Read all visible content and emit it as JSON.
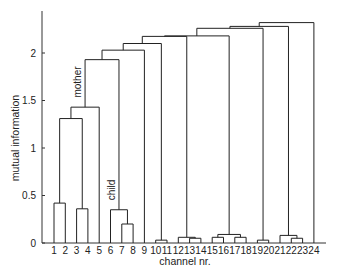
{
  "chart_data": {
    "type": "dendrogram",
    "title": "",
    "xlabel": "channel nr.",
    "ylabel": "mutual information",
    "ylim": [
      0,
      2.45
    ],
    "yticks": [
      0,
      0.5,
      1,
      1.5,
      2
    ],
    "ytick_labels": [
      "0",
      "0.5",
      "1",
      "1.5",
      "2"
    ],
    "grid": false,
    "leaves": [
      "1",
      "2",
      "3",
      "4",
      "5",
      "6",
      "7",
      "8",
      "9",
      "10",
      "11",
      "12",
      "13",
      "14",
      "15",
      "16",
      "17",
      "18",
      "19",
      "20",
      "21",
      "22",
      "23",
      "24"
    ],
    "merges": [
      {
        "id": "c1",
        "left": "1",
        "right": "2",
        "height": 0.42
      },
      {
        "id": "c2",
        "left": "3",
        "right": "4",
        "height": 0.36
      },
      {
        "id": "c3",
        "left": "c1",
        "right": "c2",
        "height": 1.31
      },
      {
        "id": "c4",
        "left": "c3",
        "right": "5",
        "height": 1.43
      },
      {
        "id": "c5",
        "left": "7",
        "right": "8",
        "height": 0.2
      },
      {
        "id": "c6",
        "left": "6",
        "right": "c5",
        "height": 0.35
      },
      {
        "id": "c7",
        "left": "c4",
        "right": "c6",
        "height": 1.93
      },
      {
        "id": "c8",
        "left": "c7",
        "right": "9",
        "height": 2.03
      },
      {
        "id": "c9",
        "left": "10",
        "right": "11",
        "height": 0.03
      },
      {
        "id": "c10",
        "left": "c8",
        "right": "c9",
        "height": 2.1
      },
      {
        "id": "c11",
        "left": "13",
        "right": "14",
        "height": 0.05
      },
      {
        "id": "c12",
        "left": "12",
        "right": "c11",
        "height": 0.06
      },
      {
        "id": "c13",
        "left": "c10",
        "right": "c12",
        "height": 2.175
      },
      {
        "id": "c14",
        "left": "15",
        "right": "16",
        "height": 0.06
      },
      {
        "id": "c15",
        "left": "17",
        "right": "18",
        "height": 0.06
      },
      {
        "id": "c16",
        "left": "c14",
        "right": "c15",
        "height": 0.09
      },
      {
        "id": "c17",
        "left": "c13",
        "right": "c16",
        "height": 2.18
      },
      {
        "id": "c18",
        "left": "19",
        "right": "20",
        "height": 0.03
      },
      {
        "id": "c19",
        "left": "c17",
        "right": "c18",
        "height": 2.26
      },
      {
        "id": "c20",
        "left": "22",
        "right": "23",
        "height": 0.05
      },
      {
        "id": "c21",
        "left": "21",
        "right": "c20",
        "height": 0.08
      },
      {
        "id": "c22",
        "left": "c19",
        "right": "c21",
        "height": 2.28
      },
      {
        "id": "c23",
        "left": "c22",
        "right": "24",
        "height": 2.32
      }
    ],
    "annotations": [
      {
        "text": "mother",
        "near_merge": "c7",
        "orientation": "vertical"
      },
      {
        "text": "child",
        "near_merge": "c6",
        "orientation": "vertical"
      }
    ]
  },
  "labels": {
    "xlabel": "channel nr.",
    "ylabel": "mutual information",
    "mother": "mother",
    "child": "child"
  }
}
